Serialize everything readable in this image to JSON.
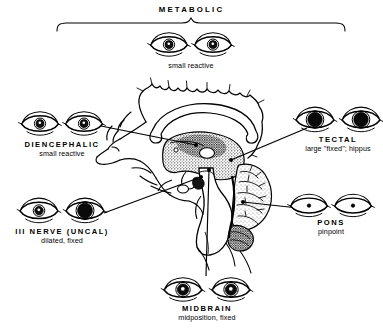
{
  "figure": {
    "title": "METABOLIC",
    "background_color": "#ffffff",
    "ink_color": "#000000"
  },
  "bracket": {
    "label": "METABOLIC",
    "label_x": 191,
    "label_y": 11,
    "span_x1": 57,
    "span_x2": 345,
    "y": 22
  },
  "groups": [
    {
      "id": "metabolic",
      "name": "metabolic",
      "label": "METABOLIC",
      "detail": "small reactive",
      "label_cx": 191,
      "label_cy": 68,
      "show_primary_label": false,
      "eyes": {
        "cx": 191,
        "cy": 45,
        "gap": 44,
        "eye_w": 37,
        "eye_h": 21,
        "left": {
          "pupil": "small",
          "pupil_r": 4.0,
          "fill": "#111111",
          "highlight": true
        },
        "right": {
          "pupil": "small",
          "pupil_r": 4.0,
          "fill": "#111111",
          "highlight": true
        }
      }
    },
    {
      "id": "diencephalic",
      "name": "diencephalic",
      "label": "DIENCEPHALIC",
      "detail": "small reactive",
      "label_cx": 62,
      "label_cy": 147,
      "show_primary_label": true,
      "eyes": {
        "cx": 62,
        "cy": 124,
        "gap": 44,
        "eye_w": 37,
        "eye_h": 21,
        "left": {
          "pupil": "small",
          "pupil_r": 4.0,
          "fill": "#111111",
          "highlight": true
        },
        "right": {
          "pupil": "small",
          "pupil_r": 4.0,
          "fill": "#111111",
          "highlight": true
        }
      }
    },
    {
      "id": "tectal",
      "name": "tectal",
      "label": "TECTAL",
      "detail": "large \"fixed\"; hippus",
      "label_cx": 338,
      "label_cy": 142,
      "show_primary_label": true,
      "eyes": {
        "cx": 338,
        "cy": 120,
        "gap": 46,
        "eye_w": 38,
        "eye_h": 22,
        "left": {
          "pupil": "large",
          "pupil_r": 7.2,
          "fill": "#0a0a0a",
          "highlight": false
        },
        "right": {
          "pupil": "large",
          "pupil_r": 7.2,
          "fill": "#0a0a0a",
          "highlight": false
        }
      }
    },
    {
      "id": "third-nerve-uncal",
      "name": "third-nerve-uncal",
      "label": "III NERVE (UNCAL)",
      "detail": "dilated, fixed",
      "label_cx": 62,
      "label_cy": 234,
      "show_primary_label": true,
      "eyes": {
        "cx": 62,
        "cy": 211,
        "gap": 46,
        "eye_w": 38,
        "eye_h": 22,
        "left": {
          "pupil": "small",
          "pupil_r": 4.2,
          "fill": "#111111",
          "highlight": true
        },
        "right": {
          "pupil": "dilated",
          "pupil_r": 7.4,
          "fill": "#0a0a0a",
          "highlight": false
        }
      }
    },
    {
      "id": "pons",
      "name": "pons",
      "label": "PONS",
      "detail": "pinpoint",
      "label_cx": 331,
      "label_cy": 225,
      "show_primary_label": true,
      "eyes": {
        "cx": 331,
        "cy": 206,
        "gap": 44,
        "eye_w": 37,
        "eye_h": 20,
        "left": {
          "pupil": "pinpoint",
          "pupil_r": 1.7,
          "fill": "#000000",
          "highlight": false
        },
        "right": {
          "pupil": "pinpoint",
          "pupil_r": 1.7,
          "fill": "#000000",
          "highlight": false
        }
      }
    },
    {
      "id": "midbrain",
      "name": "midbrain",
      "label": "MIDBRAIN",
      "detail": "midposition,   fixed",
      "label_cx": 207,
      "label_cy": 311,
      "show_primary_label": true,
      "eyes": {
        "cx": 207,
        "cy": 290,
        "gap": 48,
        "eye_w": 38,
        "eye_h": 21,
        "left": {
          "pupil": "midposition",
          "pupil_r": 5.6,
          "fill": "#0d0d0d",
          "highlight": true
        },
        "right": {
          "pupil": "midposition",
          "pupil_r": 5.6,
          "fill": "#0d0d0d",
          "highlight": true
        }
      }
    }
  ],
  "pointers": [
    {
      "name": "pointer-diencephalic",
      "x1": 101,
      "y1": 126,
      "x2": 196,
      "y2": 145
    },
    {
      "name": "pointer-third-nerve",
      "x1": 104,
      "y1": 213,
      "x2": 201,
      "y2": 177
    },
    {
      "name": "pointer-tectal",
      "x1": 231,
      "y1": 160,
      "x2": 307,
      "y2": 128
    },
    {
      "name": "pointer-pons",
      "x1": 243,
      "y1": 202,
      "x2": 298,
      "y2": 208
    },
    {
      "name": "pointer-midbrain",
      "x1": 209,
      "y1": 170,
      "x2": 206,
      "y2": 276
    }
  ],
  "brain": {
    "name": "midsagittal-brain-section",
    "structures": [
      "cortex",
      "corpus-callosum",
      "thalamus",
      "brainstem",
      "cerebellum",
      "midbrain",
      "pons"
    ]
  }
}
